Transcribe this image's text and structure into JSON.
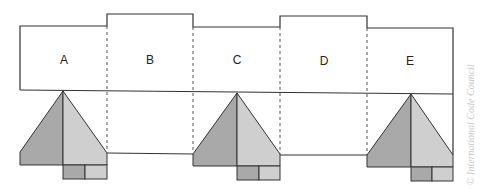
{
  "diagram": {
    "sections": [
      {
        "label": "A"
      },
      {
        "label": "B"
      },
      {
        "label": "C"
      },
      {
        "label": "D"
      },
      {
        "label": "E"
      }
    ],
    "credit": "© International Code Council",
    "colors": {
      "outline": "#333333",
      "dashed": "#555555",
      "dark_fill": "#a9a9a9",
      "light_fill": "#cfcfcf"
    }
  }
}
